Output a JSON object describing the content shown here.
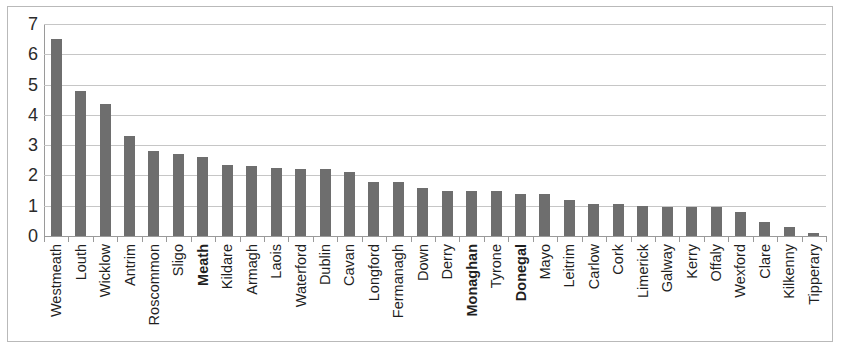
{
  "chart_data": {
    "type": "bar",
    "title": "",
    "xlabel": "",
    "ylabel": "",
    "ylim": [
      0,
      7
    ],
    "yticks": [
      0,
      1,
      2,
      3,
      4,
      5,
      6,
      7
    ],
    "ytick_labels": [
      "0",
      "1",
      "2",
      "3",
      "4",
      "5",
      "6",
      "7"
    ],
    "grid": true,
    "legend": null,
    "bar_color": "#6e6e6e",
    "gridline_color": "#c6c6c6",
    "axis_color": "#9a9a9a",
    "categories": [
      "Westmeath",
      "Louth",
      "Wicklow",
      "Antrim",
      "Roscommon",
      "Sligo",
      "Meath",
      "Kildare",
      "Armagh",
      "Laois",
      "Waterford",
      "Dublin",
      "Cavan",
      "Longford",
      "Fermanagh",
      "Down",
      "Derry",
      "Monaghan",
      "Tyrone",
      "Donegal",
      "Mayo",
      "Leitrim",
      "Carlow",
      "Cork",
      "Limerick",
      "Galway",
      "Kerry",
      "Offaly",
      "Wexford",
      "Clare",
      "Kilkenny",
      "Tipperary"
    ],
    "values": [
      6.5,
      4.8,
      4.35,
      3.3,
      2.8,
      2.7,
      2.6,
      2.35,
      2.3,
      2.25,
      2.2,
      2.2,
      2.1,
      1.8,
      1.8,
      1.6,
      1.5,
      1.5,
      1.5,
      1.4,
      1.4,
      1.2,
      1.05,
      1.05,
      1.0,
      0.95,
      0.95,
      0.95,
      0.8,
      0.45,
      0.3,
      0.1
    ],
    "bold_categories": [
      "Meath",
      "Monaghan",
      "Donegal"
    ]
  }
}
